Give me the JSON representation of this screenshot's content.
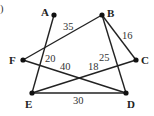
{
  "figure": {
    "corner_mark": ")",
    "nodes": [
      {
        "id": "A",
        "label": "A",
        "x": 54,
        "y": 15,
        "lx": 41,
        "ly": 16
      },
      {
        "id": "B",
        "label": "B",
        "x": 102,
        "y": 15,
        "lx": 107,
        "ly": 17
      },
      {
        "id": "C",
        "label": "C",
        "x": 136,
        "y": 60,
        "lx": 141,
        "ly": 64
      },
      {
        "id": "D",
        "label": "D",
        "x": 126,
        "y": 93,
        "lx": 127,
        "ly": 108
      },
      {
        "id": "E",
        "label": "E",
        "x": 32,
        "y": 93,
        "lx": 25,
        "ly": 108
      },
      {
        "id": "F",
        "label": "F",
        "x": 23,
        "y": 60,
        "lx": 9,
        "ly": 64
      }
    ],
    "edges": [
      {
        "from": "A",
        "to": "E",
        "weight": "20",
        "lx": 45,
        "ly": 62
      },
      {
        "from": "B",
        "to": "F",
        "weight": "35",
        "lx": 63,
        "ly": 30
      },
      {
        "from": "B",
        "to": "C",
        "weight": "16",
        "lx": 122,
        "ly": 39
      },
      {
        "from": "B",
        "to": "D",
        "weight": "25",
        "lx": 99,
        "ly": 61
      },
      {
        "from": "F",
        "to": "D",
        "weight": "40",
        "lx": 60,
        "ly": 70
      },
      {
        "from": "E",
        "to": "C",
        "weight": "18",
        "lx": 88,
        "ly": 70
      },
      {
        "from": "E",
        "to": "D",
        "weight": "30",
        "lx": 73,
        "ly": 104
      }
    ]
  }
}
